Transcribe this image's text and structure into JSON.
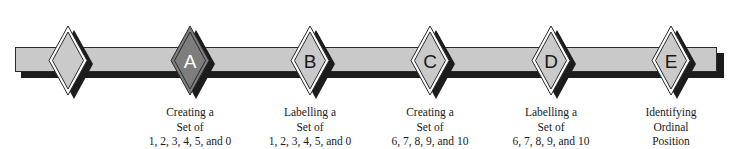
{
  "diagram": {
    "type": "timeline",
    "colors": {
      "bar_fill": "#c9c9c9",
      "bar_stroke": "#2a2a2a",
      "shadow": "#1c1c1c",
      "diamond_fill": "#cacaca",
      "diamond_active_fill": "#7d7d7d",
      "letter": "#1a1a1a",
      "letter_active": "#ffffff"
    },
    "start_marker": {
      "label": ""
    },
    "milestones": [
      {
        "letter": "A",
        "active": true,
        "lines": [
          "Creating a",
          "Set of",
          "1, 2, 3, 4, 5, and 0"
        ]
      },
      {
        "letter": "B",
        "active": false,
        "lines": [
          "Labelling a",
          "Set of",
          "1, 2, 3, 4, 5, and 0"
        ]
      },
      {
        "letter": "C",
        "active": false,
        "lines": [
          "Creating a",
          "Set of",
          "6, 7, 8, 9, and 10"
        ]
      },
      {
        "letter": "D",
        "active": false,
        "lines": [
          "Labelling a",
          "Set of",
          "6, 7, 8, 9, and 10"
        ]
      },
      {
        "letter": "E",
        "active": false,
        "lines": [
          "Identifying",
          "Ordinal",
          "Position"
        ]
      }
    ]
  }
}
